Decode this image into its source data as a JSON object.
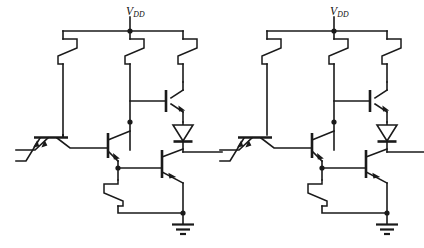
{
  "figure": {
    "title": "",
    "type": "circuit-schematic",
    "background_color": "#ffffff",
    "line_color": "#1a1a1a"
  },
  "labels": {
    "supply_left": {
      "symbol": "V",
      "subscript": "DD",
      "x": 126,
      "y": 6
    },
    "supply_right": {
      "symbol": "V",
      "subscript": "DD",
      "x": 330,
      "y": 6
    }
  },
  "gates": [
    {
      "name": "gate-1",
      "origin_x": 0,
      "supply_node_x": 130,
      "components": {
        "input_transistor": "multi-emitter-npn",
        "emitter_count": 2,
        "phase_splitter": "npn",
        "output_upper": "npn",
        "output_lower": "npn",
        "level_shift_diode": "diode",
        "resistors": 4
      }
    },
    {
      "name": "gate-2",
      "origin_x": 204,
      "supply_node_x": 334,
      "components": {
        "input_transistor": "multi-emitter-npn",
        "emitter_count": 2,
        "phase_splitter": "npn",
        "output_upper": "npn",
        "output_lower": "npn",
        "level_shift_diode": "diode",
        "resistors": 4
      }
    }
  ],
  "nets": {
    "supply_rail": "VDD",
    "ground_symbol": "earth-ground-three-bar",
    "input_count_per_gate": 2,
    "interconnect": "gate-1 output drives gate-2 input"
  }
}
